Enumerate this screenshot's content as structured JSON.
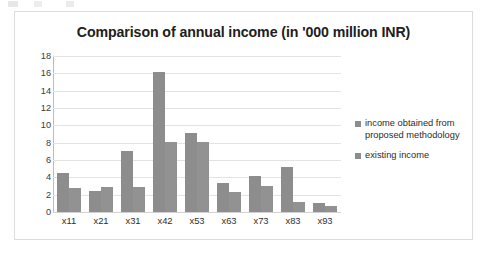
{
  "chart_data": {
    "type": "bar",
    "title": "Comparison of annual income (in '000 million INR)",
    "xlabel": "",
    "ylabel": "",
    "ylim": [
      0,
      18
    ],
    "ytick_step": 2,
    "yticks": [
      "0",
      "2",
      "4",
      "6",
      "8",
      "10",
      "12",
      "14",
      "16",
      "18"
    ],
    "grid": true,
    "legend_position": "right",
    "categories": [
      "x11",
      "x21",
      "x31",
      "x42",
      "x53",
      "x63",
      "x73",
      "x83",
      "x93"
    ],
    "series": [
      {
        "name": "income obtained from proposed methodology",
        "color": "#8d8d8d",
        "values": [
          4.5,
          2.4,
          7.0,
          16.2,
          9.15,
          3.35,
          4.2,
          5.2,
          1.05
        ]
      },
      {
        "name": "existing income",
        "color": "#929292",
        "values": [
          2.75,
          2.9,
          2.9,
          8.1,
          8.05,
          2.3,
          3.0,
          1.2,
          0.7
        ]
      }
    ]
  },
  "legend": {
    "items": [
      {
        "label_line1": "income obtained from",
        "label_line2": "proposed methodology"
      },
      {
        "label_line1": "existing income",
        "label_line2": ""
      }
    ]
  }
}
